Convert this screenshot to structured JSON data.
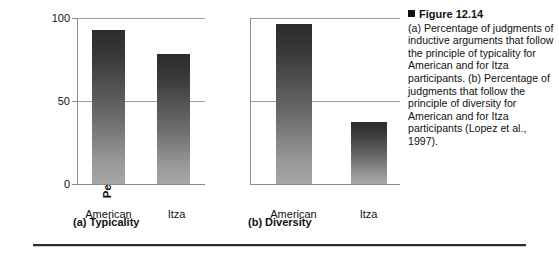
{
  "figure": {
    "bullet_icon": "black-square-bullet",
    "heading": "Figure 12.14",
    "caption": "(a) Percentage of judgments of inductive arguments that follow the principle of typicality for American and for Itza participants. (b) Percentage of judgments that follow the principle of diversity for American and for Itza participants (Lopez et al., 1997)."
  },
  "panel_a": {
    "subcaption": "(a) Typicality",
    "ylabel": "Percent matching prediction",
    "yticks": [
      "0",
      "50",
      "100"
    ],
    "xticklabels": [
      "American",
      "Itza"
    ]
  },
  "panel_b": {
    "subcaption": "(b) Diversity",
    "xticklabels": [
      "American",
      "Itza"
    ]
  },
  "chart_data": [
    {
      "type": "bar",
      "title": "(a) Typicality",
      "categories": [
        "American",
        "Itza"
      ],
      "values": [
        92,
        78
      ],
      "xlabel": "",
      "ylabel": "Percent matching prediction",
      "ylim": [
        0,
        100
      ],
      "yticks": [
        0,
        50,
        100
      ],
      "grid": true,
      "legend": "none",
      "bar_fill": "vertical-gradient dark-gray to light-gray",
      "bar_color_top": "#2b2b2b",
      "bar_color_bottom": "#a6a6a6"
    },
    {
      "type": "bar",
      "title": "(b) Diversity",
      "categories": [
        "American",
        "Itza"
      ],
      "values": [
        96,
        37
      ],
      "xlabel": "",
      "ylabel": "",
      "ylim": [
        0,
        100
      ],
      "yticks": [
        0,
        50,
        100
      ],
      "grid": true,
      "legend": "none",
      "bar_fill": "vertical-gradient dark-gray to light-gray",
      "bar_color_top": "#2b2b2b",
      "bar_color_bottom": "#a6a6a6"
    }
  ]
}
